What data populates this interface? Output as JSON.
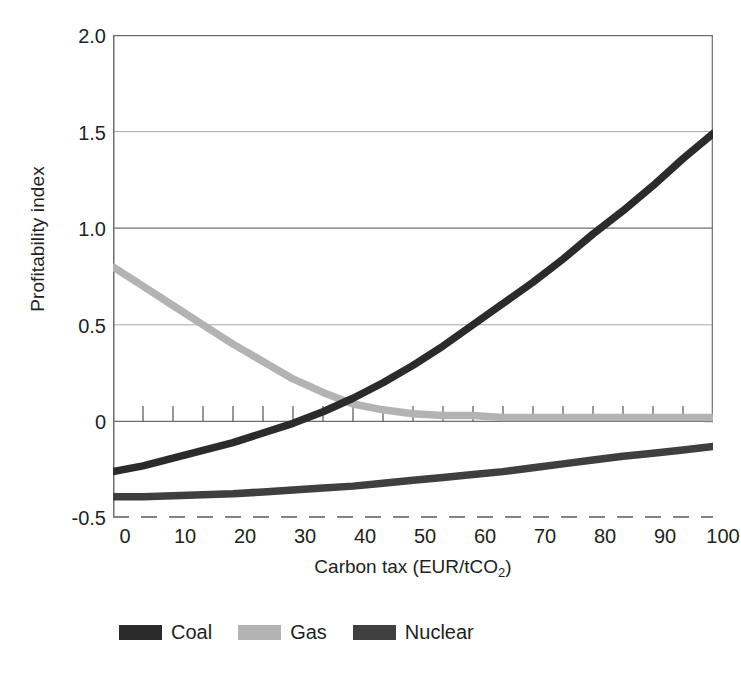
{
  "chart_data": {
    "type": "line",
    "title": "",
    "xlabel": "Carbon tax (EUR/tCO2)",
    "xlabel_main": "Carbon tax (EUR/tCO",
    "xlabel_sub": "2",
    "xlabel_tail": ")",
    "ylabel": "Profitability index",
    "xlim": [
      0,
      100
    ],
    "ylim": [
      -0.5,
      2.0
    ],
    "x_ticks": [
      0,
      10,
      20,
      30,
      40,
      50,
      60,
      70,
      80,
      90,
      100
    ],
    "x_tick_labels": [
      "0",
      "10",
      "20",
      "30",
      "40",
      "50",
      "60",
      "70",
      "80",
      "90",
      "100"
    ],
    "x_minor_tick_step": 5,
    "y_ticks": [
      -0.5,
      0,
      0.5,
      1.0,
      1.5,
      2.0
    ],
    "y_tick_labels": [
      "-0.5",
      "0",
      "0.5",
      "1.0",
      "1.5",
      "2.0"
    ],
    "grid": "horizontal gridlines at y = 0, 0.5, 1.0, 1.5, 2.0; dashed baseline at y = -0.5",
    "legend_position": "bottom-left",
    "x": [
      0,
      5,
      10,
      15,
      20,
      25,
      30,
      35,
      40,
      45,
      50,
      55,
      60,
      65,
      70,
      75,
      80,
      85,
      90,
      95,
      100
    ],
    "series": [
      {
        "name": "Coal",
        "color": "#2b2b2b",
        "values": [
          -0.26,
          -0.23,
          -0.19,
          -0.15,
          -0.11,
          -0.06,
          -0.01,
          0.05,
          0.12,
          0.2,
          0.29,
          0.39,
          0.5,
          0.61,
          0.72,
          0.84,
          0.97,
          1.09,
          1.22,
          1.36,
          1.49
        ]
      },
      {
        "name": "Gas",
        "color": "#b3b3b3",
        "values": [
          0.8,
          0.7,
          0.6,
          0.5,
          0.4,
          0.31,
          0.22,
          0.15,
          0.09,
          0.06,
          0.04,
          0.03,
          0.03,
          0.02,
          0.02,
          0.02,
          0.02,
          0.02,
          0.02,
          0.02,
          0.02
        ]
      },
      {
        "name": "Nuclear",
        "color": "#3f3f3f",
        "values": [
          -0.39,
          -0.39,
          -0.385,
          -0.38,
          -0.375,
          -0.365,
          -0.355,
          -0.345,
          -0.335,
          -0.32,
          -0.305,
          -0.29,
          -0.275,
          -0.26,
          -0.24,
          -0.22,
          -0.2,
          -0.18,
          -0.165,
          -0.148,
          -0.13
        ]
      }
    ],
    "axis_color": "#6d6e71",
    "grid_color": "#939598",
    "baseline_style": "dashed",
    "text_color": "#231f20"
  },
  "legend": {
    "entries": [
      {
        "label": "Coal",
        "swatch": "#2b2b2b"
      },
      {
        "label": "Gas",
        "swatch": "#b3b3b3"
      },
      {
        "label": "Nuclear",
        "swatch": "#3f3f3f"
      }
    ]
  }
}
